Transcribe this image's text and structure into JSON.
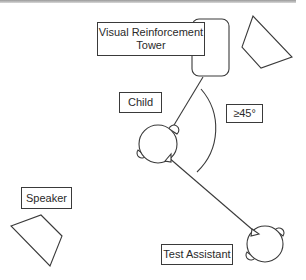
{
  "diagram": {
    "labels": {
      "tower": "Visual Reinforcement\nTower",
      "child": "Child",
      "angle": "≥45°",
      "speaker": "Speaker",
      "test_assistant": "Test Assistant"
    },
    "colors": {
      "stroke": "#3a3a3a",
      "background": "#ffffff",
      "top_rule": "#9a9a9a"
    }
  }
}
